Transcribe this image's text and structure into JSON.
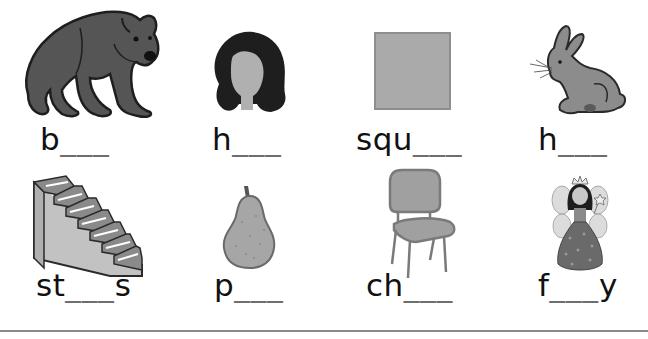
{
  "worksheet": {
    "items": [
      {
        "picture": "bear",
        "prefix": "b",
        "blank": "___",
        "suffix": ""
      },
      {
        "picture": "hair",
        "prefix": "h",
        "blank": "___",
        "suffix": ""
      },
      {
        "picture": "square",
        "prefix": "squ",
        "blank": "___",
        "suffix": ""
      },
      {
        "picture": "hare",
        "prefix": "h",
        "blank": "___",
        "suffix": ""
      },
      {
        "picture": "stairs",
        "prefix": "st",
        "blank": "___",
        "suffix": "s"
      },
      {
        "picture": "pear",
        "prefix": "p",
        "blank": "___",
        "suffix": ""
      },
      {
        "picture": "chair",
        "prefix": "ch",
        "blank": "___",
        "suffix": ""
      },
      {
        "picture": "fairy",
        "prefix": "f",
        "blank": "___",
        "suffix": "y"
      }
    ],
    "colors": {
      "outline": "#2a2a2a",
      "bear_fill": "#555555",
      "hair_fill": "#1e1e1e",
      "face_fill": "#b0b0b0",
      "square_fill": "#aaaaaa",
      "hare_fill": "#8c8c8c",
      "stairs_fill": "#9a9a9a",
      "pear_fill": "#a6a6a6",
      "chair_fill": "#a0a0a0",
      "blank_color": "#6e6e6e",
      "rule_color": "#8a8a8a"
    }
  }
}
